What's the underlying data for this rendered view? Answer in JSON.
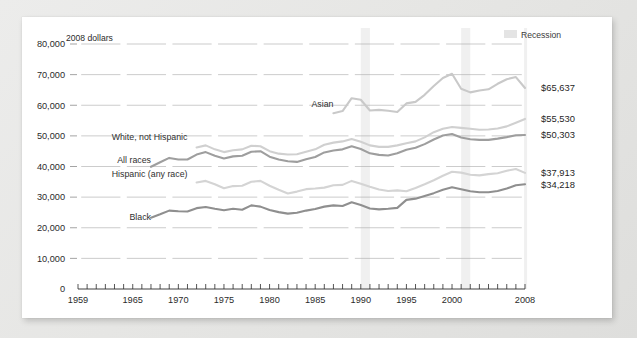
{
  "figure": {
    "unit_label": "2008 dollars",
    "recession_legend": "Recession",
    "background_color": "#e6e6e4",
    "card_color": "#ffffff"
  },
  "chart_data": {
    "type": "line",
    "title": "",
    "subtitle": "",
    "xlabel": "",
    "ylabel": "2008 dollars",
    "xlim": [
      1959,
      2008
    ],
    "ylim": [
      0,
      80000
    ],
    "grid": true,
    "legend_position": "inline-labels",
    "ytick_labels": [
      "0",
      "10,000",
      "20,000",
      "30,000",
      "40,000",
      "50,000",
      "60,000",
      "70,000",
      "80,000"
    ],
    "ytick_values": [
      0,
      10000,
      20000,
      30000,
      40000,
      50000,
      60000,
      70000,
      80000
    ],
    "xtick_labels": [
      "1959",
      "1965",
      "1970",
      "1975",
      "1980",
      "1985",
      "1990",
      "1995",
      "2000",
      "2008"
    ],
    "xtick_values": [
      1959,
      1965,
      1970,
      1975,
      1980,
      1985,
      1990,
      1995,
      2000,
      2008
    ],
    "minor_xticks_every": 1,
    "annotations": [
      {
        "text": "Recession",
        "note": "shaded vertical band near 2001 and 2008"
      }
    ],
    "recession_bands": [
      [
        1990,
        1991
      ],
      [
        2001,
        2002
      ],
      [
        2007.9,
        2008
      ]
    ],
    "series": [
      {
        "name": "Asian",
        "label": "Asian",
        "color": "#c9c9c9",
        "end_value_label": "$65,637",
        "end_value": 65637,
        "label_x": 1987,
        "label_y": 59500,
        "x": [
          1987,
          1988,
          1989,
          1990,
          1991,
          1992,
          1993,
          1994,
          1995,
          1996,
          1997,
          1998,
          1999,
          2000,
          2001,
          2002,
          2003,
          2004,
          2005,
          2006,
          2007,
          2008
        ],
        "values": [
          57400,
          58100,
          62300,
          61800,
          58300,
          58500,
          58200,
          57800,
          60600,
          61100,
          63400,
          66300,
          68900,
          70300,
          65400,
          64200,
          64800,
          65200,
          67000,
          68500,
          69200,
          65637
        ]
      },
      {
        "name": "White, not Hispanic",
        "label": "White, not Hispanic",
        "color": "#d0d0d0",
        "end_value_label": "$55,530",
        "end_value": 55530,
        "label_x": 1971,
        "label_y": 48800,
        "x": [
          1972,
          1973,
          1974,
          1975,
          1976,
          1977,
          1978,
          1979,
          1980,
          1981,
          1982,
          1983,
          1984,
          1985,
          1986,
          1987,
          1988,
          1989,
          1990,
          1991,
          1992,
          1993,
          1994,
          1995,
          1996,
          1997,
          1998,
          1999,
          2000,
          2001,
          2002,
          2003,
          2004,
          2005,
          2006,
          2007,
          2008
        ],
        "values": [
          46200,
          46900,
          45600,
          44700,
          45300,
          45600,
          46800,
          46600,
          45000,
          44200,
          43900,
          44000,
          44800,
          45600,
          47100,
          47800,
          48200,
          49000,
          48100,
          46900,
          46400,
          46400,
          46900,
          47600,
          48200,
          49500,
          51200,
          52300,
          52900,
          52600,
          52300,
          52000,
          52100,
          52400,
          53100,
          54300,
          55530
        ]
      },
      {
        "name": "All races",
        "label": "All races",
        "color": "#9e9e9e",
        "end_value_label": "$50,303",
        "end_value": 50303,
        "label_x": 1967,
        "label_y": 41000,
        "x": [
          1967,
          1968,
          1969,
          1970,
          1971,
          1972,
          1973,
          1974,
          1975,
          1976,
          1977,
          1978,
          1979,
          1980,
          1981,
          1982,
          1983,
          1984,
          1985,
          1986,
          1987,
          1988,
          1989,
          1990,
          1991,
          1992,
          1993,
          1994,
          1995,
          1996,
          1997,
          1998,
          1999,
          2000,
          2001,
          2002,
          2003,
          2004,
          2005,
          2006,
          2007,
          2008
        ],
        "values": [
          39900,
          41400,
          42800,
          42300,
          42300,
          43900,
          44700,
          43500,
          42600,
          43300,
          43500,
          44800,
          45000,
          43200,
          42300,
          41700,
          41500,
          42400,
          43100,
          44600,
          45200,
          45600,
          46600,
          45700,
          44300,
          43800,
          43600,
          44300,
          45500,
          46100,
          47300,
          48800,
          50100,
          50600,
          49500,
          48900,
          48700,
          48700,
          49100,
          49600,
          50200,
          50303
        ]
      },
      {
        "name": "Hispanic (any race)",
        "label": "Hispanic (any race)",
        "color": "#d4d4d4",
        "end_value_label": "$37,913",
        "end_value": 37913,
        "label_x": 1971,
        "label_y": 36700,
        "x": [
          1972,
          1973,
          1974,
          1975,
          1976,
          1977,
          1978,
          1979,
          1980,
          1981,
          1982,
          1983,
          1984,
          1985,
          1986,
          1987,
          1988,
          1989,
          1990,
          1991,
          1992,
          1993,
          1994,
          1995,
          1996,
          1997,
          1998,
          1999,
          2000,
          2001,
          2002,
          2003,
          2004,
          2005,
          2006,
          2007,
          2008
        ],
        "values": [
          34800,
          35300,
          34200,
          32900,
          33600,
          33700,
          35000,
          35300,
          33700,
          32400,
          31200,
          31800,
          32600,
          32800,
          33100,
          33900,
          34000,
          35300,
          34400,
          33400,
          32500,
          32000,
          32200,
          31900,
          33000,
          34200,
          35500,
          37000,
          38300,
          38000,
          37300,
          37100,
          37500,
          37800,
          38600,
          39200,
          37913
        ]
      },
      {
        "name": "Black",
        "label": "Black",
        "color": "#8f8f8f",
        "end_value_label": "$34,218",
        "end_value": 34218,
        "label_x": 1967,
        "label_y": 22600,
        "x": [
          1967,
          1968,
          1969,
          1970,
          1971,
          1972,
          1973,
          1974,
          1975,
          1976,
          1977,
          1978,
          1979,
          1980,
          1981,
          1982,
          1983,
          1984,
          1985,
          1986,
          1987,
          1988,
          1989,
          1990,
          1991,
          1992,
          1993,
          1994,
          1995,
          1996,
          1997,
          1998,
          1999,
          2000,
          2001,
          2002,
          2003,
          2004,
          2005,
          2006,
          2007,
          2008
        ],
        "values": [
          23300,
          24400,
          25600,
          25400,
          25300,
          26400,
          26800,
          26200,
          25700,
          26200,
          25900,
          27300,
          26900,
          25800,
          25100,
          24600,
          24900,
          25600,
          26100,
          26900,
          27300,
          27100,
          28300,
          27400,
          26300,
          26000,
          26200,
          26500,
          29100,
          29500,
          30400,
          31300,
          32400,
          33200,
          32600,
          31900,
          31600,
          31600,
          32000,
          32800,
          33900,
          34218
        ]
      }
    ]
  }
}
